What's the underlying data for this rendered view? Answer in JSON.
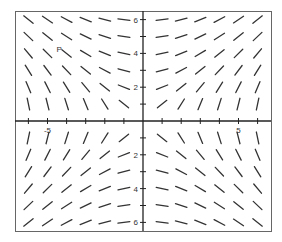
{
  "chart_data": {
    "type": "slope_field",
    "title": "",
    "equation_hint": "dy/dx proportional to x/y",
    "xlabel": "",
    "ylabel": "",
    "xlim": [
      -6.5,
      6.5
    ],
    "ylim": [
      -6.5,
      6.5
    ],
    "grid": false,
    "x_ticks": [
      -6,
      -5,
      -4,
      -3,
      -2,
      -1,
      1,
      2,
      3,
      4,
      5,
      6
    ],
    "y_ticks": [
      -6,
      -5,
      -4,
      -3,
      -2,
      -1,
      1,
      2,
      3,
      4,
      5,
      6
    ],
    "x_tick_labels": [
      {
        "value": -5,
        "text": "-5"
      },
      {
        "value": 5,
        "text": "5"
      }
    ],
    "y_tick_labels": [
      {
        "value": 6,
        "text": "6"
      },
      {
        "value": 4,
        "text": "4"
      },
      {
        "value": 2,
        "text": "2"
      },
      {
        "value": -2,
        "text": "2"
      },
      {
        "value": -4,
        "text": "4"
      },
      {
        "value": -6,
        "text": "6"
      }
    ],
    "sample_points_x": [
      -6,
      -5,
      -4,
      -3,
      -2,
      -1,
      1,
      2,
      3,
      4,
      5,
      6
    ],
    "sample_points_y": [
      6,
      5,
      4,
      3,
      2,
      1,
      -1,
      -2,
      -3,
      -4,
      -5,
      -6
    ],
    "annotation": {
      "text": "P",
      "x": -4,
      "y": 4.5
    },
    "colors": {
      "segment": "#333333",
      "axis": "#222222",
      "frame": "#555555"
    }
  }
}
